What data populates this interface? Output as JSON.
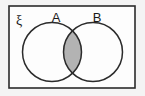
{
  "figure": {
    "kind": "venn-diagram",
    "caption_text": "",
    "background_color": "#f4f4f4",
    "canvas": {
      "width": 145,
      "height": 96
    }
  },
  "universal_set": {
    "symbol": "ξ",
    "label_position": {
      "x": 16,
      "y": 25
    },
    "frame": {
      "x": 9,
      "y": 6,
      "width": 126,
      "height": 82,
      "stroke_color": "#2b2b2b",
      "stroke_width": 1.6,
      "fill_color": "#fdfdfd"
    }
  },
  "sets": [
    {
      "label": "A",
      "label_position": {
        "x": 56,
        "y": 22
      },
      "circle": {
        "cx": 52,
        "cy": 52,
        "r": 29.5
      },
      "stroke_color": "#2b2b2b",
      "stroke_width": 1.5,
      "fill_color": "none"
    },
    {
      "label": "B",
      "label_position": {
        "x": 97,
        "y": 22
      },
      "circle": {
        "cx": 93,
        "cy": 52,
        "r": 29.5
      },
      "stroke_color": "#2b2b2b",
      "stroke_width": 1.5,
      "fill_color": "none"
    }
  ],
  "shaded_region": {
    "name": "A intersect B",
    "notation": "A ∩ B",
    "fill_color": "#b3b3b3",
    "stroke_color": "#2b2b2b",
    "stroke_width": 1.4
  },
  "chart_data": {
    "type": "venn",
    "title": "",
    "universe_label": "ξ",
    "set_labels": [
      "A",
      "B"
    ],
    "shaded_regions": [
      "A∩B"
    ],
    "unshaded_regions": [
      "A only",
      "B only",
      "outside A and B"
    ],
    "shade_color": "#b3b3b3",
    "outline_color": "#2b2b2b",
    "legend": "none",
    "grid": false
  }
}
